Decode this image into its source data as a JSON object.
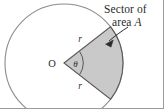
{
  "figure": {
    "canvas": {
      "width": 164,
      "height": 109,
      "background": "#ffffff"
    },
    "circle": {
      "center_label": "O",
      "center_x": 64,
      "center_y": 63,
      "radius": 59,
      "stroke_color": "#8c8c8c"
    },
    "sector": {
      "fill_color": "#c9c9c9",
      "stroke_color": "#5a5a5a",
      "start_angle_deg": -38,
      "end_angle_deg": 38,
      "angle_label": "θ",
      "radius_label_upper": "r",
      "radius_label_lower": "r"
    },
    "callout": {
      "line1": "Sector of",
      "line2_prefix": "area ",
      "line2_variable": "A",
      "arrow_color": "#2b2b2b"
    },
    "edges": {
      "rule_color": "#9a9a9a"
    }
  }
}
